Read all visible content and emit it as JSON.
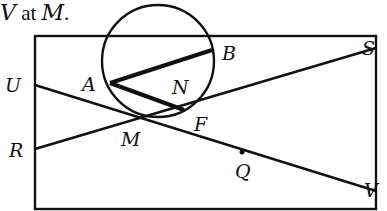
{
  "caption": {
    "prefix": "V",
    "middle": " at ",
    "suffix": "M",
    "period": "."
  },
  "points": {
    "U": "U",
    "R": "R",
    "A": "A",
    "B": "B",
    "N": "N",
    "F": "F",
    "M": "M",
    "Q": "Q",
    "S": "S",
    "V": "V"
  },
  "colors": {
    "ink": "#111111",
    "background": "#ffffff"
  }
}
